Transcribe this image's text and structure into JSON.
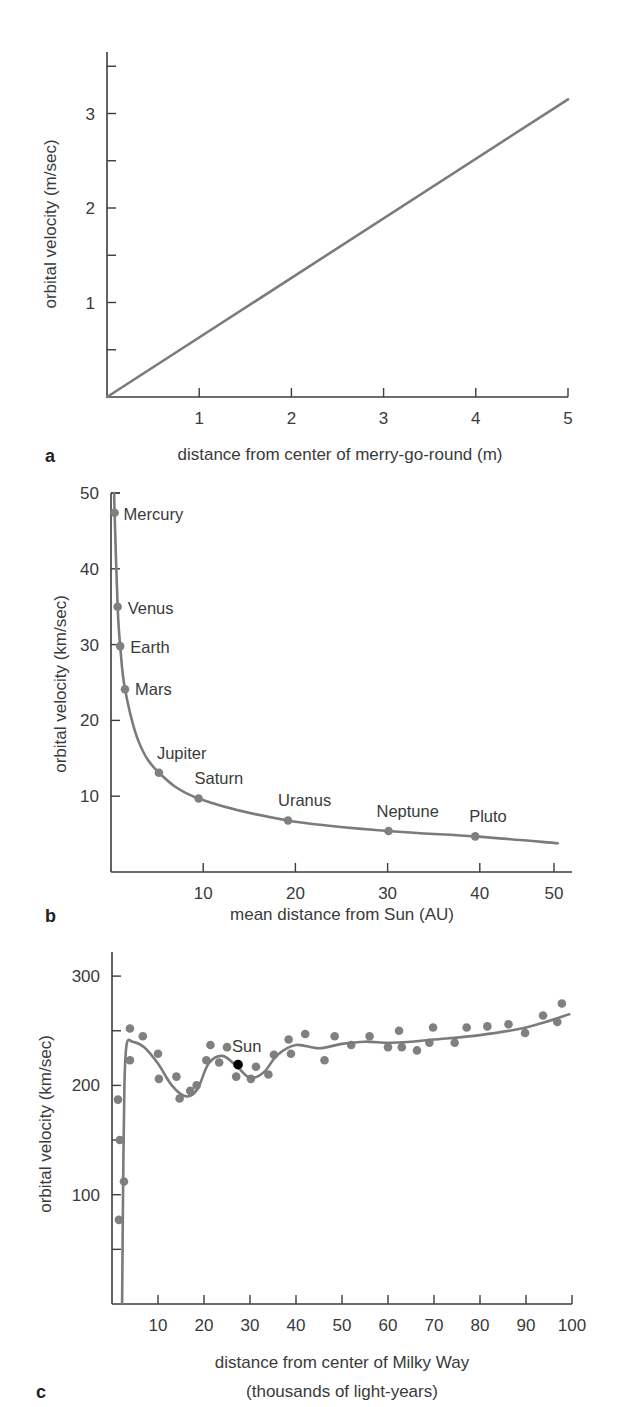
{
  "chart_data": [
    {
      "id": "a",
      "type": "line",
      "panel_label": "a",
      "xlabel": "distance from center of merry-go-round (m)",
      "ylabel": "orbital velocity (m/sec)",
      "xlim": [
        0,
        5
      ],
      "ylim": [
        0,
        3.7
      ],
      "x_ticks": [
        1,
        2,
        3,
        4,
        5
      ],
      "x_tick_labels": [
        "1",
        "2",
        "3",
        "4",
        "5"
      ],
      "y_ticks": [
        0.5,
        1,
        1.5,
        2,
        2.5,
        3,
        3.5
      ],
      "y_tick_labels": [
        "",
        "1",
        "",
        "2",
        "",
        "3",
        ""
      ],
      "grid": false,
      "series": [
        {
          "name": "merry-go-round",
          "x": [
            0,
            5
          ],
          "y": [
            0,
            3.15
          ]
        }
      ]
    },
    {
      "id": "b",
      "type": "line",
      "panel_label": "b",
      "xlabel": "mean distance from Sun (AU)",
      "ylabel": "orbital velocity (km/sec)",
      "xlim": [
        0,
        52
      ],
      "ylim": [
        0,
        50
      ],
      "x_ticks": [
        10,
        20,
        30,
        40,
        50
      ],
      "x_tick_labels": [
        "10",
        "20",
        "30",
        "40",
        "50"
      ],
      "y_ticks": [
        10,
        20,
        30,
        40,
        50
      ],
      "y_tick_labels": [
        "10",
        "20",
        "30",
        "40",
        "50"
      ],
      "grid": false,
      "series": [
        {
          "name": "Keplerian curve",
          "x": [
            0.35,
            0.39,
            0.72,
            1.0,
            1.52,
            3.0,
            5.2,
            9.5,
            19.2,
            30.1,
            39.5,
            50.5
          ],
          "y": [
            50,
            47.4,
            35.0,
            29.8,
            24.1,
            17.2,
            13.1,
            9.7,
            6.8,
            5.4,
            4.7,
            3.8
          ]
        }
      ],
      "points": [
        {
          "label": "Mercury",
          "x": 0.39,
          "y": 47.4
        },
        {
          "label": "Venus",
          "x": 0.72,
          "y": 35.0
        },
        {
          "label": "Earth",
          "x": 1.0,
          "y": 29.8
        },
        {
          "label": "Mars",
          "x": 1.52,
          "y": 24.1
        },
        {
          "label": "Jupiter",
          "x": 5.2,
          "y": 13.1
        },
        {
          "label": "Saturn",
          "x": 9.5,
          "y": 9.7
        },
        {
          "label": "Uranus",
          "x": 19.2,
          "y": 6.8
        },
        {
          "label": "Neptune",
          "x": 30.1,
          "y": 5.4
        },
        {
          "label": "Pluto",
          "x": 39.5,
          "y": 4.7
        }
      ]
    },
    {
      "id": "c",
      "type": "scatter",
      "panel_label": "c",
      "xlabel": "distance from center of Milky Way",
      "xlabel_line2": "(thousands of light-years)",
      "ylabel": "orbital velocity (km/sec)",
      "xlim": [
        0,
        100
      ],
      "ylim": [
        0,
        320
      ],
      "x_ticks": [
        10,
        20,
        30,
        40,
        50,
        60,
        70,
        80,
        90,
        100
      ],
      "x_tick_labels": [
        "10",
        "20",
        "30",
        "40",
        "50",
        "60",
        "70",
        "80",
        "90",
        "100"
      ],
      "y_ticks": [
        50,
        100,
        150,
        200,
        250,
        300
      ],
      "y_tick_labels": [
        "",
        "100",
        "",
        "200",
        "",
        "300"
      ],
      "grid": false,
      "series": [
        {
          "name": "rotation curve",
          "x": [
            2.2,
            2.4,
            2.7,
            3.2,
            4.5,
            7,
            10,
            13,
            16,
            18.5,
            21,
            24,
            27,
            30,
            33,
            36,
            40,
            45,
            50,
            55,
            60,
            65,
            70,
            80,
            90,
            99.4
          ],
          "y": [
            0,
            100,
            200,
            238,
            240,
            235,
            220,
            200,
            190,
            196,
            220,
            227,
            218,
            207,
            212,
            228,
            237,
            234,
            238,
            240,
            239,
            240,
            242,
            246,
            253,
            265
          ]
        }
      ],
      "points": [
        {
          "x": 1.3,
          "y": 187
        },
        {
          "x": 1.7,
          "y": 150
        },
        {
          "x": 2.6,
          "y": 112
        },
        {
          "x": 1.5,
          "y": 77
        },
        {
          "x": 3.9,
          "y": 252
        },
        {
          "x": 3.9,
          "y": 223
        },
        {
          "x": 6.7,
          "y": 245
        },
        {
          "x": 10.0,
          "y": 229
        },
        {
          "x": 10.2,
          "y": 206
        },
        {
          "x": 14.0,
          "y": 208
        },
        {
          "x": 14.7,
          "y": 188
        },
        {
          "x": 17.0,
          "y": 195
        },
        {
          "x": 18.4,
          "y": 200
        },
        {
          "x": 20.5,
          "y": 223
        },
        {
          "x": 21.4,
          "y": 237
        },
        {
          "x": 23.3,
          "y": 221
        },
        {
          "x": 25.0,
          "y": 235
        },
        {
          "x": 27.0,
          "y": 208
        },
        {
          "x": 30.2,
          "y": 206
        },
        {
          "x": 31.3,
          "y": 217
        },
        {
          "x": 34.0,
          "y": 210
        },
        {
          "x": 35.2,
          "y": 228
        },
        {
          "x": 38.4,
          "y": 242
        },
        {
          "x": 38.9,
          "y": 229
        },
        {
          "x": 42.0,
          "y": 247
        },
        {
          "x": 46.2,
          "y": 223
        },
        {
          "x": 48.4,
          "y": 245
        },
        {
          "x": 52.0,
          "y": 237
        },
        {
          "x": 56.0,
          "y": 245
        },
        {
          "x": 60.0,
          "y": 235
        },
        {
          "x": 62.4,
          "y": 250
        },
        {
          "x": 63.0,
          "y": 235
        },
        {
          "x": 66.3,
          "y": 232
        },
        {
          "x": 69.0,
          "y": 239
        },
        {
          "x": 69.8,
          "y": 253
        },
        {
          "x": 74.5,
          "y": 239
        },
        {
          "x": 77.1,
          "y": 253
        },
        {
          "x": 81.6,
          "y": 254
        },
        {
          "x": 86.2,
          "y": 256
        },
        {
          "x": 89.8,
          "y": 248
        },
        {
          "x": 93.7,
          "y": 264
        },
        {
          "x": 96.8,
          "y": 258
        },
        {
          "x": 97.8,
          "y": 275
        }
      ],
      "highlight": {
        "label": "Sun",
        "x": 27.4,
        "y": 219,
        "color": "#000000"
      }
    }
  ],
  "colors": {
    "axis": "#3c3c3c",
    "curve": "#7b7b7b",
    "point": "#808080",
    "highlight": "#000000",
    "text": "#3a3a3a"
  }
}
